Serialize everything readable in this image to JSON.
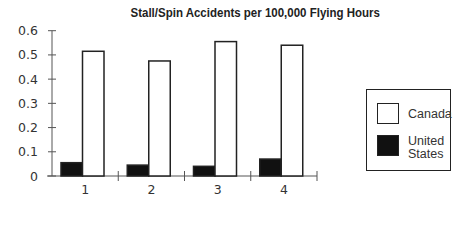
{
  "chart_data": {
    "type": "bar",
    "title": "Stall/Spin Accidents per 100,000 Flying Hours",
    "xlabel": "",
    "ylabel": "",
    "categories": [
      "1",
      "2",
      "3",
      "4"
    ],
    "series": [
      {
        "name": "United States",
        "color": "#111111",
        "values": [
          0.055,
          0.045,
          0.04,
          0.07
        ]
      },
      {
        "name": "Canada",
        "color": "#ffffff",
        "values": [
          0.515,
          0.475,
          0.555,
          0.54
        ]
      }
    ],
    "ylim": [
      0,
      0.6
    ],
    "yticks": [
      "0",
      "0.1",
      "0.2",
      "0.3",
      "0.4",
      "0.5",
      "0.6"
    ],
    "grid": false,
    "legend_position": "right"
  },
  "legend": {
    "items": [
      {
        "label_lines": [
          "Canada"
        ],
        "swatch": "#ffffff"
      },
      {
        "label_lines": [
          "United",
          "States"
        ],
        "swatch": "#111111"
      }
    ]
  }
}
